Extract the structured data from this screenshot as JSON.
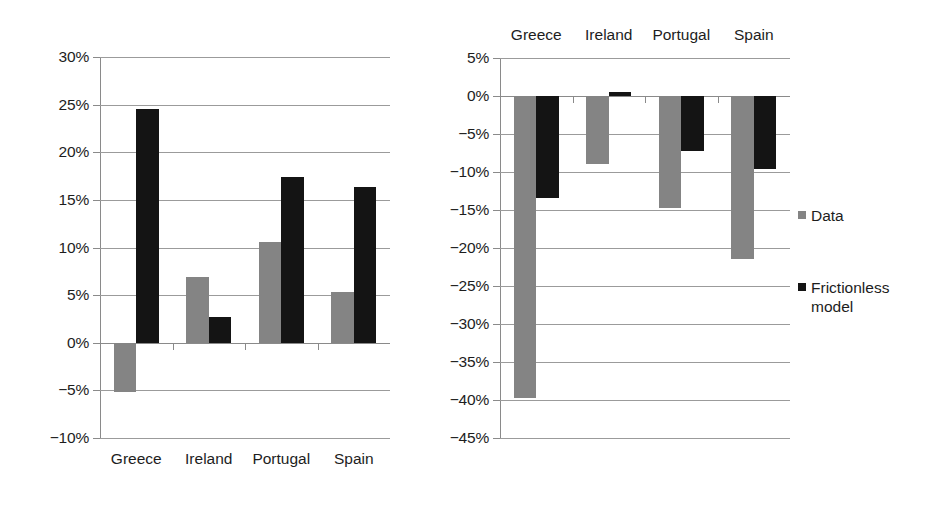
{
  "legend": {
    "entries": [
      {
        "label": "Data",
        "color": "#848484",
        "key": "data"
      },
      {
        "label": "Frictionless\nmodel",
        "color": "#141414",
        "key": "model"
      }
    ]
  },
  "chart_data": [
    {
      "id": "left-chart",
      "type": "bar",
      "title": "",
      "xlabel": "",
      "ylabel": "",
      "categories": [
        "Greece",
        "Ireland",
        "Portugal",
        "Spain"
      ],
      "category_axis_position": "bottom",
      "ylim": [
        -10,
        30
      ],
      "ytick_values": [
        30,
        25,
        20,
        15,
        10,
        5,
        0,
        -5,
        -10
      ],
      "ytick_labels": [
        "30%",
        "25%",
        "20%",
        "15%",
        "10%",
        "5%",
        "0%",
        "−5%",
        "−10%"
      ],
      "grid": true,
      "legend_position": "right-outside",
      "series": [
        {
          "name": "Data",
          "color": "#848484",
          "values": [
            -5.2,
            6.9,
            10.6,
            5.3
          ]
        },
        {
          "name": "Frictionless model",
          "color": "#141414",
          "values": [
            24.5,
            2.7,
            17.4,
            16.3
          ]
        }
      ]
    },
    {
      "id": "right-chart",
      "type": "bar",
      "title": "",
      "xlabel": "",
      "ylabel": "",
      "categories": [
        "Greece",
        "Ireland",
        "Portugal",
        "Spain"
      ],
      "category_axis_position": "top",
      "ylim": [
        -45,
        5
      ],
      "ytick_values": [
        5,
        0,
        -5,
        -10,
        -15,
        -20,
        -25,
        -30,
        -35,
        -40,
        -45
      ],
      "ytick_labels": [
        "5%",
        "0%",
        "−5%",
        "−10%",
        "−15%",
        "−20%",
        "−25%",
        "−30%",
        "−35%",
        "−40%",
        "−45%"
      ],
      "grid": true,
      "legend_position": "right-outside",
      "series": [
        {
          "name": "Data",
          "color": "#848484",
          "values": [
            -39.7,
            -8.9,
            -14.7,
            -21.4
          ]
        },
        {
          "name": "Frictionless model",
          "color": "#141414",
          "values": [
            -13.4,
            0.5,
            -7.3,
            -9.6
          ]
        }
      ]
    }
  ]
}
